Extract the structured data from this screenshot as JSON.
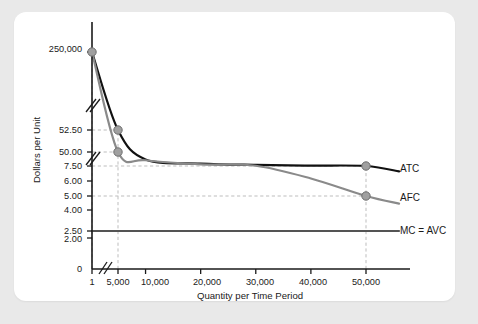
{
  "chart_data": {
    "type": "line",
    "title": "",
    "xlabel": "Quantity per Time Period",
    "ylabel": "Dollars per Unit",
    "grid": true,
    "legend_position": "right-of-curve-end",
    "axis_breaks": {
      "y": [
        "between 250,000 and 52.50",
        "between 50.00 and 7.50"
      ],
      "x": [
        "between 1 and 5,000"
      ]
    },
    "x_ticks": [
      {
        "label": "1",
        "value": 1
      },
      {
        "label": "5,000",
        "value": 5000
      },
      {
        "label": "10,000",
        "value": 10000
      },
      {
        "label": "20,000",
        "value": 20000
      },
      {
        "label": "30,000",
        "value": 30000
      },
      {
        "label": "40,000",
        "value": 40000
      },
      {
        "label": "50,000",
        "value": 50000
      }
    ],
    "y_ticks": [
      {
        "label": "250,000",
        "value": 250000
      },
      {
        "label": "52.50",
        "value": 52.5
      },
      {
        "label": "50.00",
        "value": 50.0
      },
      {
        "label": "7.50",
        "value": 7.5
      },
      {
        "label": "6.00",
        "value": 6.0
      },
      {
        "label": "5.00",
        "value": 5.0
      },
      {
        "label": "4.00",
        "value": 4.0
      },
      {
        "label": "2.50",
        "value": 2.5
      },
      {
        "label": "2.00",
        "value": 2.0
      },
      {
        "label": "0",
        "value": 0
      }
    ],
    "series": [
      {
        "name": "ATC",
        "label": "ATC",
        "color": "#111111",
        "points": [
          {
            "x": 1,
            "y": 250000
          },
          {
            "x": 5000,
            "y": 52.5
          },
          {
            "x": 10000,
            "y": 27.5
          },
          {
            "x": 20000,
            "y": 15.0
          },
          {
            "x": 30000,
            "y": 10.83
          },
          {
            "x": 40000,
            "y": 8.75
          },
          {
            "x": 50000,
            "y": 7.5
          },
          {
            "x": 56000,
            "y": 6.96
          }
        ],
        "markers": [
          {
            "x": 1,
            "y": 250000
          },
          {
            "x": 5000,
            "y": 52.5
          },
          {
            "x": 50000,
            "y": 7.5
          }
        ]
      },
      {
        "name": "AFC",
        "label": "AFC",
        "color": "#8a8a8a",
        "points": [
          {
            "x": 1,
            "y": 250000
          },
          {
            "x": 5000,
            "y": 50.0
          },
          {
            "x": 10000,
            "y": 25.0
          },
          {
            "x": 20000,
            "y": 12.5
          },
          {
            "x": 30000,
            "y": 8.33
          },
          {
            "x": 40000,
            "y": 6.25
          },
          {
            "x": 50000,
            "y": 5.0
          },
          {
            "x": 56000,
            "y": 4.46
          }
        ],
        "markers": [
          {
            "x": 5000,
            "y": 50.0
          },
          {
            "x": 50000,
            "y": 5.0
          }
        ]
      },
      {
        "name": "MC = AVC",
        "label": "MC = AVC",
        "color": "#545454",
        "constant": 2.5,
        "points": [
          {
            "x": 1,
            "y": 2.5
          },
          {
            "x": 56000,
            "y": 2.5
          }
        ],
        "markers": []
      }
    ],
    "annotations": [
      {
        "type": "hline-dashed",
        "y": 52.5,
        "from_x": 1,
        "to_x": 5000
      },
      {
        "type": "hline-dashed",
        "y": 50.0,
        "from_x": 1,
        "to_x": 5000
      },
      {
        "type": "hline-dashed",
        "y": 7.5,
        "from_x": 1,
        "to_x": 50000
      },
      {
        "type": "hline-dashed",
        "y": 5.0,
        "from_x": 1,
        "to_x": 50000
      },
      {
        "type": "vline-dashed",
        "x": 1,
        "from_y": 0,
        "to_y": 250000
      },
      {
        "type": "vline-dashed",
        "x": 5000,
        "from_y": 0,
        "to_y": 52.5
      },
      {
        "type": "vline-dashed",
        "x": 50000,
        "from_y": 0,
        "to_y": 7.5
      }
    ]
  },
  "labels": {
    "y_axis_title": "Dollars per Unit",
    "x_axis_title": "Quantity per Time Period",
    "y_250000": "250,000",
    "y_5250": "52.50",
    "y_5000": "50.00",
    "y_750": "7.50",
    "y_600": "6.00",
    "y_500": "5.00",
    "y_400": "4.00",
    "y_250": "2.50",
    "y_200": "2.00",
    "y_0": "0",
    "x_1": "1",
    "x_5000": "5,000",
    "x_10000": "10,000",
    "x_20000": "20,000",
    "x_30000": "30,000",
    "x_40000": "40,000",
    "x_50000": "50,000",
    "series_atc": "ATC",
    "series_afc": "AFC",
    "series_mc_avc": "MC = AVC"
  },
  "colors": {
    "page_background": "#e9e9e9",
    "card_background": "#ffffff",
    "atc": "#111111",
    "afc": "#8a8a8a",
    "mc_avc": "#545454",
    "gridline": "#b5b5b5",
    "axis": "#1a1a1a",
    "marker_fill": "#a0a0a0"
  }
}
